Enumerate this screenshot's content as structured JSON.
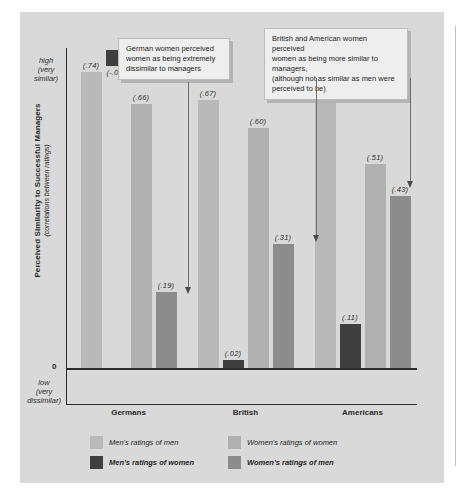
{
  "page": {
    "ghost_header": ""
  },
  "chart_data": {
    "type": "bar",
    "title": "",
    "xlabel": "",
    "ylabel": "Perceived Similarity to Successful Managers",
    "ylabel_sub": "(correlations between ratings)",
    "axis": {
      "high_label": "high\n(very\nsimilar)",
      "high_line1": "high",
      "high_line2": "(very",
      "high_line3": "similar)",
      "zero_label": "0",
      "low_line1": "low",
      "low_line2": "(very",
      "low_line3": "dissimilar)",
      "ymin": -0.1,
      "ymax": 0.8,
      "grid": false
    },
    "categories": [
      "Germans",
      "British",
      "Americans"
    ],
    "series": [
      {
        "name": "Men's ratings of men",
        "color": "#b9b9b9",
        "values": [
          0.74,
          0.67,
          0.7
        ],
        "labels": [
          "(.74)",
          "(.67)",
          "(.70)"
        ]
      },
      {
        "name": "Men's ratings of women",
        "color": "#3f3f3f",
        "values": [
          -0.04,
          0.02,
          0.11
        ],
        "labels": [
          "(-.04)",
          "(.02)",
          "(.11)"
        ]
      },
      {
        "name": "Women's ratings of women",
        "color": "#b0b0b0",
        "values": [
          0.66,
          0.6,
          0.51
        ],
        "labels": [
          "(.66)",
          "(.60)",
          "(.51)"
        ]
      },
      {
        "name": "Women's ratings of men",
        "color": "#8c8c8c",
        "values": [
          0.19,
          0.31,
          0.43
        ],
        "labels": [
          "(.19)",
          "(.31)",
          "(.43)"
        ]
      }
    ],
    "legend": {
      "position": "bottom",
      "entries": [
        {
          "label": "Men's ratings of men",
          "color": "#b9b9b9"
        },
        {
          "label": "Men's ratings of women",
          "color": "#3f3f3f"
        },
        {
          "label": "Women's ratings of women",
          "color": "#b0b0b0"
        },
        {
          "label": "Women's ratings of men",
          "color": "#8c8c8c"
        }
      ]
    },
    "annotations": [
      {
        "id": "callout-germans",
        "text": "German women perceived women as being extremely dissimilar to managers",
        "line1": "German women perceived",
        "line2": "women as being extremely",
        "line3": "dissimilar to managers",
        "points_to": "Germans / Women's ratings of men (.19)"
      },
      {
        "id": "callout-british-americans",
        "text": "British and American women perceived women as being more similar to managers, (although not as similar as men were perceived to be)",
        "line1": "British and American women perceived",
        "line2": "women as being more similar to managers,",
        "line3": "(although not as similar as men were",
        "line4": "perceived to be)",
        "points_to": "British (.31) and Americans (.43) / Women's ratings of men"
      }
    ]
  }
}
